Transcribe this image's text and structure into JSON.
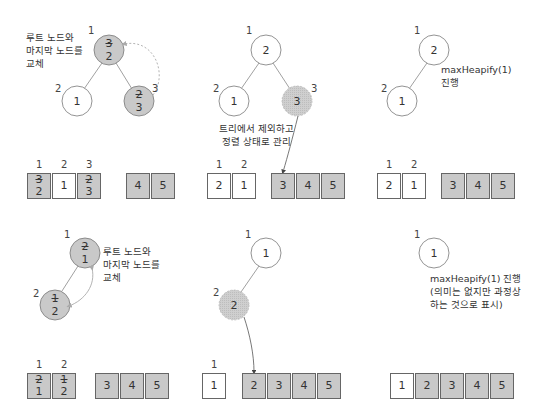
{
  "colors": {
    "shaded": "#c9c9c9",
    "outline": "#666666",
    "white": "#ffffff",
    "dashed_arrow": "#999999"
  },
  "panels": [
    {
      "id": "step1-swap",
      "note": "루트 노드와\n마지막 노드를\n교체",
      "nodes": [
        {
          "index": "1",
          "old": "3",
          "new": "2",
          "state": "swapped"
        },
        {
          "index": "2",
          "value": "1",
          "state": "normal"
        },
        {
          "index": "3",
          "old": "2",
          "new": "3",
          "state": "swapped"
        }
      ],
      "array": {
        "heap": [
          {
            "index": "1",
            "old": "3",
            "new": "2",
            "shade": "gray"
          },
          {
            "index": "2",
            "value": "1",
            "shade": "white"
          },
          {
            "index": "3",
            "old": "2",
            "new": "3",
            "shade": "gray"
          }
        ],
        "sorted": [
          "4",
          "5"
        ]
      }
    },
    {
      "id": "step2-remove",
      "note": "트리에서 제외하고\n정렬 상태로 관리",
      "nodes": [
        {
          "index": "1",
          "value": "2",
          "state": "normal"
        },
        {
          "index": "2",
          "value": "1",
          "state": "normal"
        },
        {
          "index": "3",
          "value": "3",
          "state": "removed"
        }
      ],
      "array": {
        "heap": [
          {
            "index": "1",
            "value": "2"
          },
          {
            "index": "2",
            "value": "1"
          }
        ],
        "sorted": [
          "3",
          "4",
          "5"
        ]
      }
    },
    {
      "id": "step3-heapify",
      "note": "maxHeapify(1)\n진행",
      "nodes": [
        {
          "index": "1",
          "value": "2",
          "state": "normal"
        },
        {
          "index": "2",
          "value": "1",
          "state": "normal"
        }
      ],
      "array": {
        "heap": [
          {
            "index": "1",
            "value": "2"
          },
          {
            "index": "2",
            "value": "1"
          }
        ],
        "sorted": [
          "3",
          "4",
          "5"
        ]
      }
    },
    {
      "id": "step4-swap",
      "note": "루트 노드와\n마지막 노드를\n교체",
      "nodes": [
        {
          "index": "1",
          "old": "2",
          "new": "1",
          "state": "swapped"
        },
        {
          "index": "2",
          "old": "1",
          "new": "2",
          "state": "swapped"
        }
      ],
      "array": {
        "heap": [
          {
            "index": "1",
            "old": "2",
            "new": "1",
            "shade": "gray"
          },
          {
            "index": "2",
            "old": "1",
            "new": "2",
            "shade": "gray"
          }
        ],
        "sorted": [
          "3",
          "4",
          "5"
        ]
      }
    },
    {
      "id": "step5-remove",
      "nodes": [
        {
          "index": "1",
          "value": "1",
          "state": "normal"
        },
        {
          "index": "2",
          "value": "2",
          "state": "removed"
        }
      ],
      "array": {
        "heap": [
          {
            "index": "1",
            "value": "1"
          }
        ],
        "sorted": [
          "2",
          "3",
          "4",
          "5"
        ]
      }
    },
    {
      "id": "step6-heapify",
      "note": "maxHeapify(1) 진행\n(의미는 없지만 과정상\n하는 것으로 표시)",
      "nodes": [
        {
          "index": "1",
          "value": "1",
          "state": "normal"
        }
      ],
      "array": {
        "heap": [
          {
            "index": "1",
            "value": "1"
          }
        ],
        "sorted": [
          "2",
          "3",
          "4",
          "5"
        ]
      }
    }
  ]
}
